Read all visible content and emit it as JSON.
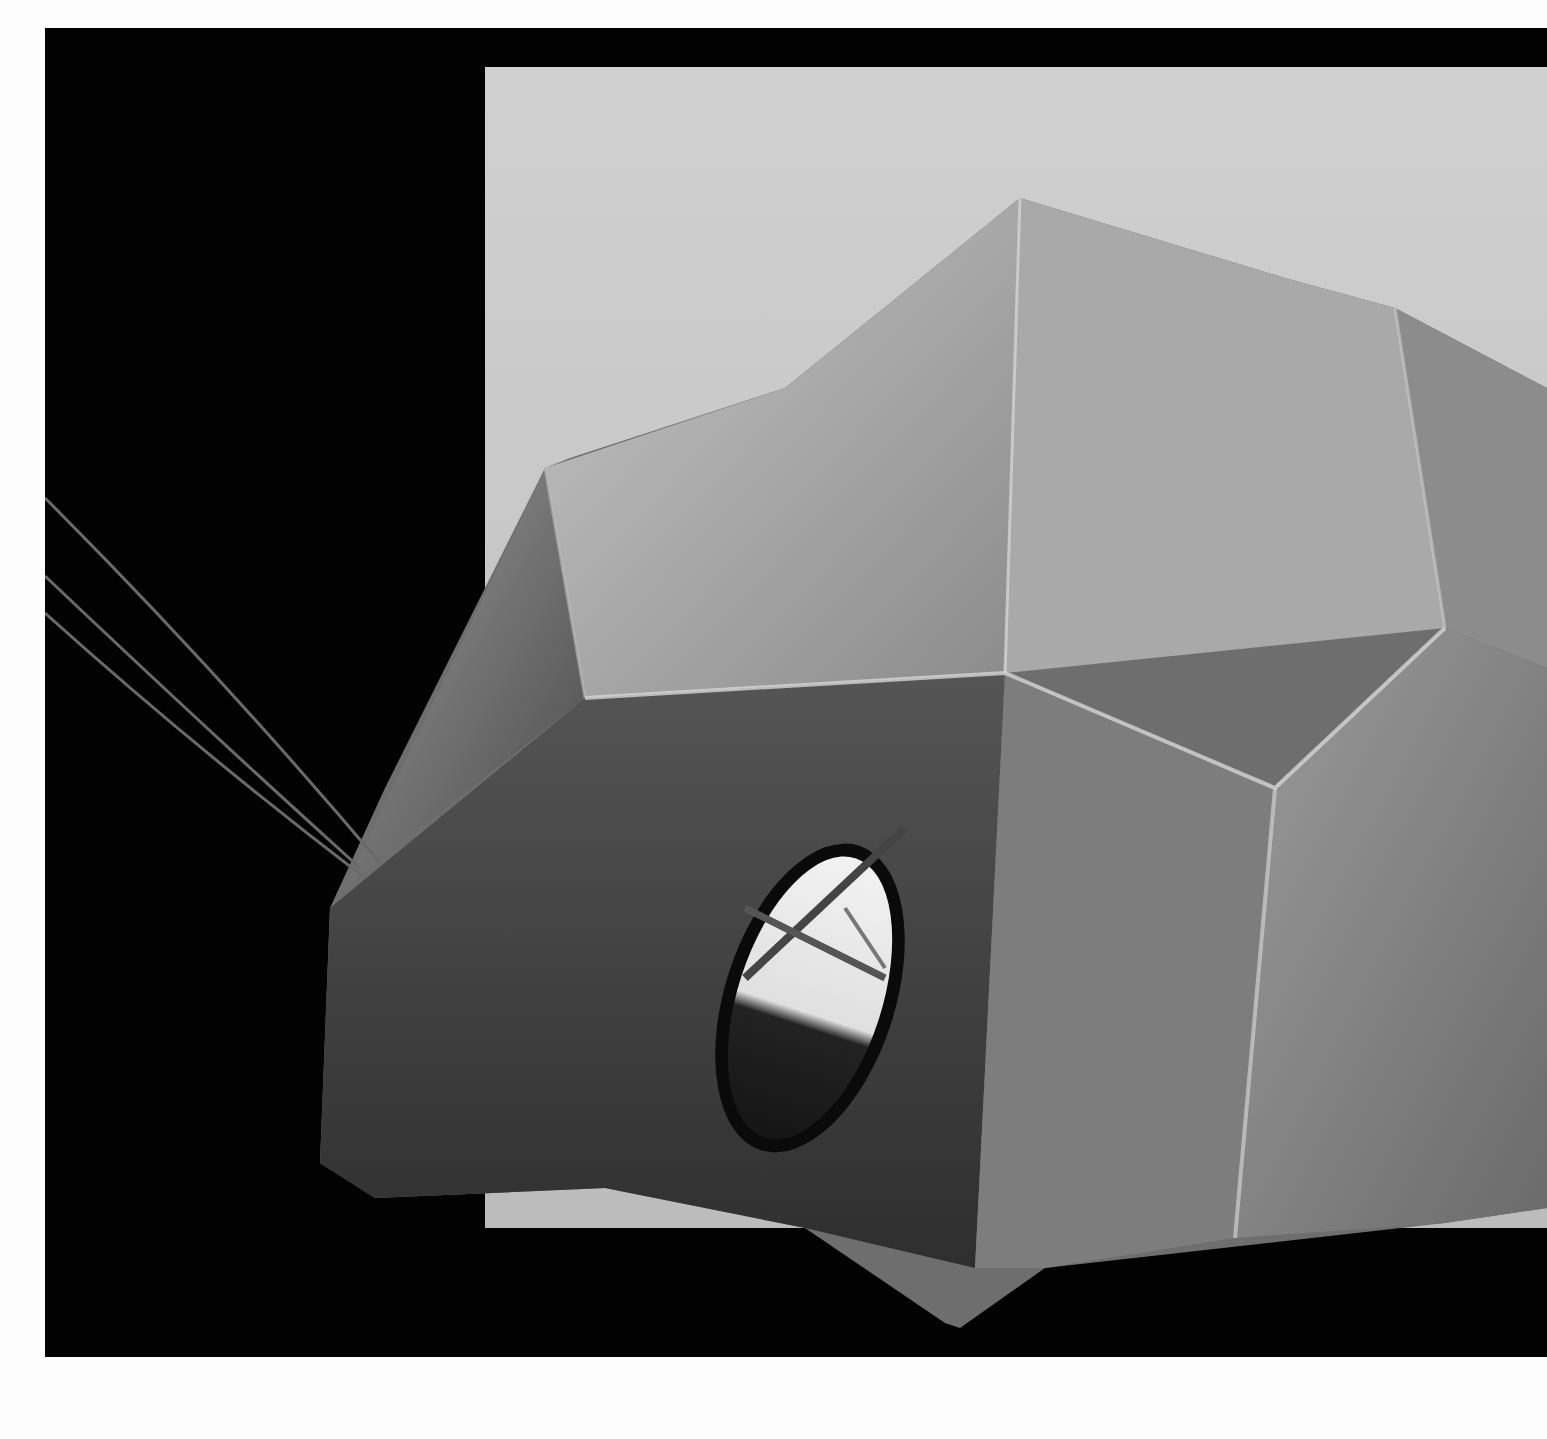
{
  "image": {
    "kind": "black-and-white photograph",
    "subject": "faceted dome-shaped sculpture with an oval window and wires entering from the left",
    "colors": {
      "page_background": "#fdfdfd",
      "frame": "#020202",
      "backdrop": "#c9c9c9",
      "sculpture_light": "#bdbdbd",
      "sculpture_mid": "#7a7a7a",
      "sculpture_dark": "#3a3a3a",
      "window_light": "#eeeeee"
    }
  }
}
